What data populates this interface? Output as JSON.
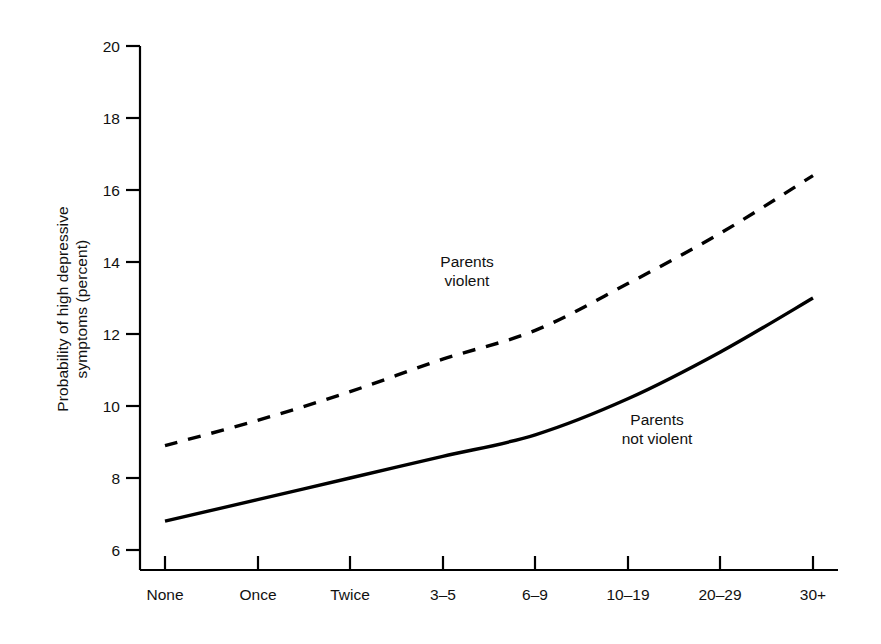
{
  "chart_data": {
    "type": "line",
    "title": "",
    "subtitle": "",
    "xlabel": "",
    "ylabel": "Probability of high depressive\nsymptoms (percent)",
    "categories": [
      "None",
      "Once",
      "Twice",
      "3–5",
      "6–9",
      "10–19",
      "20–29",
      "30+"
    ],
    "ylim": [
      6,
      20
    ],
    "yticks": [
      6,
      8,
      10,
      12,
      14,
      16,
      18,
      20
    ],
    "ytick_labels": [
      "6",
      "8",
      "10",
      "12",
      "14",
      "16",
      "18",
      "20"
    ],
    "grid": false,
    "legend_position": "inline-annotations",
    "series": [
      {
        "name": "Parents violent",
        "style": "dashed",
        "color": "#000000",
        "values": [
          8.9,
          9.6,
          10.4,
          11.3,
          12.1,
          13.4,
          14.8,
          16.4
        ]
      },
      {
        "name": "Parents not violent",
        "style": "solid",
        "color": "#000000",
        "values": [
          6.8,
          7.4,
          8.0,
          8.6,
          9.2,
          10.2,
          11.5,
          13.0
        ]
      }
    ],
    "annotations": [
      {
        "id": "parents-violent",
        "text": "Parents\nviolent",
        "x_category": "3–5",
        "y_value": 13.9
      },
      {
        "id": "parents-not-violent",
        "text": "Parents\nnot violent",
        "x_category": "20–29",
        "y_value": 10.6
      }
    ]
  },
  "axes": {
    "y_title": "Probability of high depressive\nsymptoms (percent)",
    "y_ticks": [
      "20",
      "18",
      "16",
      "14",
      "12",
      "10",
      "8",
      "6"
    ],
    "x_ticks": [
      "None",
      "Once",
      "Twice",
      "3–5",
      "6–9",
      "10–19",
      "20–29",
      "30+"
    ]
  },
  "annotations": {
    "violent": "Parents\nviolent",
    "not_violent": "Parents\nnot violent"
  },
  "colors": {
    "background": "#ffffff",
    "ink": "#000000",
    "text": "#111111"
  }
}
